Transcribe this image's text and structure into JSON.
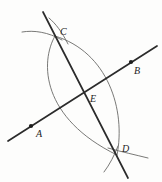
{
  "figure": {
    "width": 162,
    "height": 182,
    "background_color": "#fdfdfc",
    "line_color": "#2b2b2b",
    "arc_color": "#6a6a68",
    "label_color": "#242424"
  },
  "points": [
    {
      "name": "A",
      "label": "A",
      "x": 31,
      "y": 126,
      "label_x": 36,
      "label_y": 135,
      "has_dot": true
    },
    {
      "name": "B",
      "label": "B",
      "x": 131,
      "y": 62,
      "label_x": 134,
      "label_y": 72,
      "has_dot": true
    },
    {
      "name": "C",
      "label": "C",
      "x": 55,
      "y": 36,
      "label_x": 60,
      "label_y": 33,
      "has_dot": false
    },
    {
      "name": "D",
      "label": "D",
      "x": 117,
      "y": 155,
      "label_x": 122,
      "label_y": 150,
      "has_dot": false
    },
    {
      "name": "E",
      "label": "E",
      "x": 84,
      "y": 97,
      "label_x": 90,
      "label_y": 100,
      "has_dot": false
    }
  ],
  "lines": [
    {
      "name": "line-AB",
      "x1": 8,
      "y1": 141,
      "x2": 157,
      "y2": 46
    },
    {
      "name": "line-CD",
      "x1": 43,
      "y1": 12,
      "x2": 128,
      "y2": 178
    }
  ],
  "arcs": [
    {
      "name": "arc-left-major",
      "path": "M 55 36 C 40 62 41 118 117 155"
    },
    {
      "name": "arc-right-major",
      "path": "M 55 36 C 108 52 126 110 117 155"
    },
    {
      "name": "arc-stub-upper-left",
      "path": "M 22 32 C 34 30 48 32 62 40"
    },
    {
      "name": "arc-stub-upper-right",
      "path": "M 49 18 C 56 24 62 32 68 44"
    },
    {
      "name": "arc-stub-lower-right",
      "path": "M 148 158 C 136 155 122 152 108 148"
    },
    {
      "name": "arc-stub-lower-left",
      "path": "M 104 172 C 110 164 114 156 118 146"
    }
  ],
  "labels": {
    "A": "A",
    "B": "B",
    "C": "C",
    "D": "D",
    "E": "E"
  }
}
